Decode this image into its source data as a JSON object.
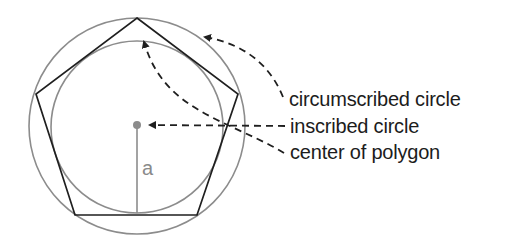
{
  "diagram": {
    "shape": "pentagon",
    "labels": {
      "circumscribed": "circumscribed circle",
      "inscribed": "inscribed circle",
      "center": "center of polygon",
      "apothem": "a"
    },
    "colors": {
      "polygon": "#1f1f1f",
      "circles": "#8c8c8c",
      "arrows": "#1f1f1f",
      "center_dot": "#8c8c8c",
      "apothem": "#8c8c8c",
      "text": "#1c1c1c"
    }
  }
}
